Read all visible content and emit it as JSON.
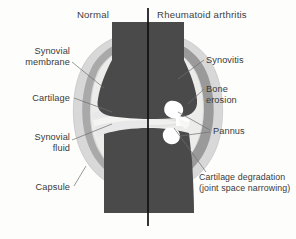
{
  "figure": {
    "title_left": "Normal",
    "title_right": "Rheumatoid arthritis",
    "labels_left": [
      {
        "id": "synovial-membrane",
        "line1": "Synovial",
        "line2": "membrane"
      },
      {
        "id": "cartilage",
        "line1": "Cartilage",
        "line2": ""
      },
      {
        "id": "synovial-fluid",
        "line1": "Synovial",
        "line2": "fluid"
      },
      {
        "id": "capsule",
        "line1": "Capsule",
        "line2": ""
      }
    ],
    "labels_right": [
      {
        "id": "synovitis",
        "line1": "Synovitis",
        "line2": ""
      },
      {
        "id": "bone-erosion",
        "line1": "Bone",
        "line2": "erosion"
      },
      {
        "id": "pannus",
        "line1": "Pannus",
        "line2": ""
      },
      {
        "id": "cartilage-degradation",
        "line1": "Cartilage degradation",
        "line2": "(joint space narrowing)"
      }
    ],
    "colors": {
      "background": "#fdfdfc",
      "bone": "#4a4a4a",
      "capsule_outer": "#d8d8d8",
      "synovial_membrane": "#a9a9a9",
      "synovitis_thick": "#9a9a9a",
      "cartilage": "#e8e8e8",
      "synovial_fluid": "#f2f2f0",
      "pannus": "#ffffff",
      "divider": "#111111",
      "text": "#3a3a3a",
      "leader": "#6e6e6e"
    }
  }
}
